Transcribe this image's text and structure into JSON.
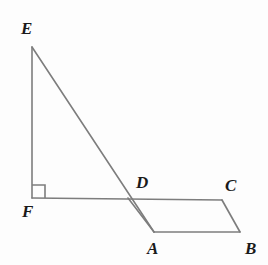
{
  "figure": {
    "background_color": "#fdfdfd",
    "stroke_color": "#7d7d7d",
    "label_color": "#1a1a1a",
    "stroke_width": 1.6,
    "width": 268,
    "height": 265
  },
  "points": {
    "E": {
      "label": "E",
      "x": 32,
      "y": 47,
      "label_x": 21,
      "label_y": 20
    },
    "F": {
      "label": "F",
      "x": 32,
      "y": 198,
      "label_x": 22,
      "label_y": 203
    },
    "A": {
      "label": "A",
      "x": 154,
      "y": 232,
      "label_x": 147,
      "label_y": 240
    },
    "B": {
      "label": "B",
      "x": 240,
      "y": 232,
      "label_x": 245,
      "label_y": 240
    },
    "C": {
      "label": "C",
      "x": 222,
      "y": 200,
      "label_x": 225,
      "label_y": 177
    },
    "D": {
      "label": "D",
      "x": 128,
      "y": 198,
      "label_x": 136,
      "label_y": 174
    }
  },
  "segments": [
    {
      "name": "segment-EF",
      "from": "E",
      "to": "F"
    },
    {
      "name": "segment-EA",
      "from": "E",
      "to": "A"
    },
    {
      "name": "segment-FC",
      "from": "F",
      "to": "C"
    },
    {
      "name": "segment-AB",
      "from": "A",
      "to": "B"
    },
    {
      "name": "segment-BC",
      "from": "B",
      "to": "C"
    }
  ],
  "right_angle_marker": {
    "name": "right-angle-at-F",
    "vertex": "F",
    "size": 13,
    "path": "M 32 185 L 45 185 L 45 198"
  },
  "polylines": {
    "triangle_EFA": "32,47 32,198 154,232",
    "parallelogram_ABCD": "154,232 240,232 222,200 128,198",
    "base_line_FC": "32,198 222,198"
  },
  "chart_data": {
    "type": "diagram",
    "vertices": [
      {
        "name": "E",
        "x": 32,
        "y": 47
      },
      {
        "name": "F",
        "x": 32,
        "y": 198
      },
      {
        "name": "A",
        "x": 154,
        "y": 232
      },
      {
        "name": "B",
        "x": 240,
        "y": 232
      },
      {
        "name": "C",
        "x": 222,
        "y": 200
      },
      {
        "name": "D",
        "x": 128,
        "y": 198
      }
    ],
    "edges": [
      [
        "E",
        "F"
      ],
      [
        "E",
        "A"
      ],
      [
        "F",
        "C"
      ],
      [
        "A",
        "B"
      ],
      [
        "B",
        "C"
      ]
    ],
    "annotations": [
      {
        "type": "right-angle",
        "at": "F",
        "between": [
          "E",
          "C"
        ]
      },
      {
        "type": "intersection",
        "at": "D",
        "of": [
          "E-A",
          "F-C"
        ]
      }
    ]
  }
}
